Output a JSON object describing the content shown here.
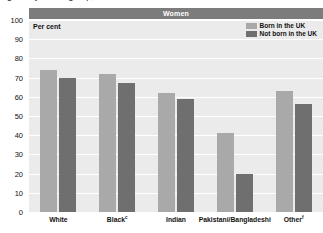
{
  "caption": "Figure: by ethnic group, 2001",
  "figure": {
    "banner_title": "Women",
    "axis_unit_label": "Per cent"
  },
  "legend": {
    "position": "top-right",
    "items": [
      {
        "label": "Born in the UK",
        "color": "#a9a9a9"
      },
      {
        "label": "Not born in the UK",
        "color": "#6f6f6f"
      }
    ]
  },
  "colors": {
    "banner": "#7c7c7c",
    "plot_background": "#ebebeb",
    "gridline": "#ffffff",
    "born_in_uk": "#a9a9a9",
    "not_born_in_uk": "#6f6f6f",
    "text": "#111111"
  },
  "chart_data": {
    "type": "bar",
    "title": "Women",
    "xlabel": "",
    "ylabel": "Per cent",
    "ylim": [
      0,
      100
    ],
    "yticks": [
      0,
      10,
      20,
      30,
      40,
      50,
      60,
      70,
      80,
      90,
      100
    ],
    "ytick_labels": [
      "0",
      "10",
      "20",
      "30",
      "40",
      "50",
      "60",
      "70",
      "80",
      "90",
      "100"
    ],
    "grid": true,
    "legend_position": "top-right",
    "categories": [
      "White",
      "Black",
      "Indian",
      "Pakistani/Bangladeshi",
      "Other"
    ],
    "category_labels": [
      "White",
      "Blackᶜ",
      "Indian",
      "Pakistani/Bangladeshi",
      "Otherᶠ"
    ],
    "category_footnotes": [
      "",
      "c",
      "",
      "",
      "f"
    ],
    "series": [
      {
        "name": "Born in the UK",
        "color": "#a9a9a9",
        "values": [
          74,
          72,
          62,
          41,
          63
        ]
      },
      {
        "name": "Not born in the UK",
        "color": "#6f6f6f",
        "values": [
          70,
          67,
          59,
          20,
          56
        ]
      }
    ]
  }
}
